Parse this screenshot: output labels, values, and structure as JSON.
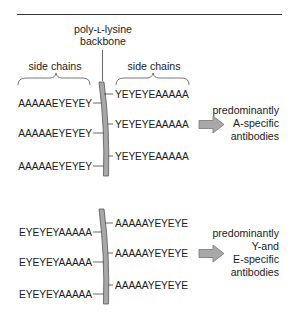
{
  "figure": {
    "backbone_label": [
      "poly-ʟ-lysine",
      "backbone"
    ],
    "side_chain_label_left": "side chains",
    "side_chain_label_right": "side chains",
    "colors": {
      "text": "#1a1a1a",
      "backbone_fill": "#a8a8a8",
      "backbone_stroke": "#555555",
      "arrow_fill": "#a8a8a8",
      "arrow_stroke": "#777777",
      "rule": "#333333"
    }
  },
  "panels": [
    {
      "id": "top",
      "left_chains": [
        "AAAAAEYEYEY",
        "AAAAAEYEYEY",
        "AAAAAEYEYEY"
      ],
      "right_chains": [
        "YEYEYEAAAAA",
        "YEYEYEAAAAA",
        "YEYEYEAAAAA"
      ],
      "result": [
        "predominantly",
        "A-specific",
        "antibodies"
      ]
    },
    {
      "id": "bottom",
      "left_chains": [
        "EYEYEYAAAAA",
        "EYEYEYAAAAA",
        "EYEYEYAAAAA"
      ],
      "right_chains": [
        "AAAAAYEYEYE",
        "AAAAAYEYEYE",
        "AAAAAYEYEYE"
      ],
      "result": [
        "predominantly",
        "Y-and",
        "E-specific",
        "antibodies"
      ]
    }
  ]
}
